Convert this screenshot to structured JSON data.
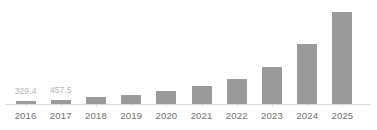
{
  "chart_data": {
    "type": "bar",
    "title": "",
    "subtitle": "",
    "xlabel": "",
    "ylabel": "",
    "categories": [
      "2016",
      "2017",
      "2018",
      "2019",
      "2020",
      "2021",
      "2022",
      "2023",
      "2024",
      "2025"
    ],
    "values": [
      329.4,
      457.5,
      790,
      1010,
      1450,
      2000,
      2750,
      4070,
      6600,
      10100
    ],
    "value_labels": [
      "329.4",
      "457.5",
      "",
      "",
      "",
      "",
      "",
      "",
      "",
      ""
    ],
    "ylim": [
      0,
      11400
    ],
    "grid": false,
    "legend": null,
    "series": [
      {
        "name": "",
        "color": "#9a9a9a",
        "values": [
          329.4,
          457.5,
          790,
          1010,
          1450,
          2000,
          2750,
          4070,
          6600,
          10100
        ]
      }
    ],
    "bar_pixel_heights": [
      3,
      4,
      7,
      9,
      13,
      18,
      25,
      37,
      60,
      92
    ],
    "axis_color": "#d9d9d9",
    "tick_color": "#dcdcdc",
    "label_color": "#6e6e6e",
    "value_label_color": "#b3b3b3",
    "background": "#ffffff"
  }
}
